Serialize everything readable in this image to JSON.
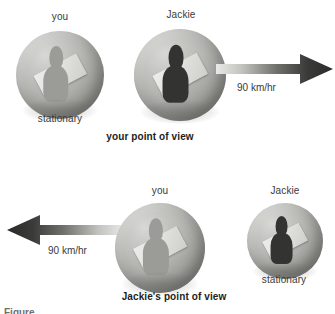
{
  "figure": {
    "partial_caption": "Figure"
  },
  "panels": [
    {
      "id": "your-point-of-view",
      "caption": "your point of view",
      "objects": [
        {
          "id": "you-top",
          "top_label": "you",
          "bottom_label": "stationary",
          "state": "stationary"
        },
        {
          "id": "jackie-top",
          "top_label": "Jackie",
          "bottom_label": "",
          "state": "moving"
        }
      ],
      "arrow": {
        "speed_label": "90 km/hr",
        "direction": "right"
      }
    },
    {
      "id": "jackies-point-of-view",
      "caption": "Jackie's point of view",
      "objects": [
        {
          "id": "you-bottom",
          "top_label": "you",
          "bottom_label": "",
          "state": "moving"
        },
        {
          "id": "jackie-bottom",
          "top_label": "Jackie",
          "bottom_label": "stationary",
          "state": "stationary"
        }
      ],
      "arrow": {
        "speed_label": "90 km/hr",
        "direction": "left"
      }
    }
  ],
  "colors": {
    "background": "#ffffff",
    "text": "#3a3a3a",
    "caption_text": "#1d1d1d",
    "sphere_light": "#d8d8d6",
    "sphere_dark": "#777774",
    "arrow_dark": "#2b2b29",
    "arrow_light": "#e9e9e7",
    "plate": "#ececea",
    "figure_dark": "#333331",
    "figure_light": "#9b9b97"
  }
}
